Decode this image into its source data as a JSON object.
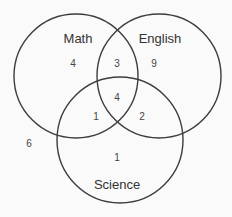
{
  "diagram": {
    "type": "venn",
    "sets": [
      {
        "name": "Math",
        "cx": 76,
        "cy": 76,
        "r": 62,
        "label_x": 78,
        "label_y": 43
      },
      {
        "name": "English",
        "cx": 159,
        "cy": 76,
        "r": 62,
        "label_x": 160,
        "label_y": 43
      },
      {
        "name": "Science",
        "cx": 120,
        "cy": 140,
        "r": 63,
        "label_x": 117,
        "label_y": 189
      }
    ],
    "regions": [
      {
        "id": "math-only",
        "sets": [
          "Math"
        ],
        "value": "4",
        "x": 73,
        "y": 67
      },
      {
        "id": "math-english",
        "sets": [
          "Math",
          "English"
        ],
        "value": "3",
        "x": 117,
        "y": 67
      },
      {
        "id": "english-only",
        "sets": [
          "English"
        ],
        "value": "9",
        "x": 154,
        "y": 67
      },
      {
        "id": "all-three",
        "sets": [
          "Math",
          "English",
          "Science"
        ],
        "value": "4",
        "x": 117,
        "y": 101
      },
      {
        "id": "math-science",
        "sets": [
          "Math",
          "Science"
        ],
        "value": "1",
        "x": 96,
        "y": 120
      },
      {
        "id": "english-science",
        "sets": [
          "English",
          "Science"
        ],
        "value": "2",
        "x": 142,
        "y": 120
      },
      {
        "id": "science-only",
        "sets": [
          "Science"
        ],
        "value": "1",
        "x": 117,
        "y": 161
      },
      {
        "id": "none",
        "sets": [],
        "value": "6",
        "x": 29,
        "y": 147
      }
    ],
    "colors": {
      "background": "#fafafa",
      "stroke": "#3d3d3d",
      "text": "#333333"
    }
  }
}
